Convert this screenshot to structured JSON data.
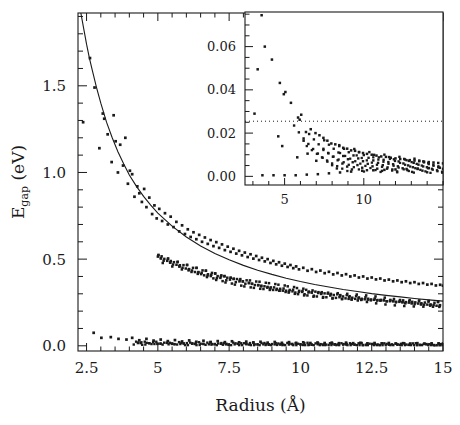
{
  "figure": {
    "background": "#ffffff",
    "ink": "#1a1a1a"
  },
  "main_axes": {
    "xlabel": "Radius (Å)",
    "ylabel_main": "E",
    "ylabel_sub": "gap",
    "ylabel_unit": " (eV)",
    "ylabel_full": "E_gap (eV)",
    "xticks": [
      "2.5",
      "5",
      "7.5",
      "10",
      "12.5",
      "15"
    ],
    "yticks": [
      "0.0",
      "0.5",
      "1.0",
      "1.5"
    ]
  },
  "inset_axes": {
    "xticks": [
      "5",
      "10"
    ],
    "yticks": [
      "0.00",
      "0.02",
      "0.04",
      "0.06"
    ]
  },
  "chart_data": {
    "type": "scatter",
    "title": "",
    "xlabel": "Radius (Å)",
    "ylabel": "E_gap (eV)",
    "xlim": [
      2.2,
      15.0
    ],
    "ylim": [
      -0.03,
      1.92
    ],
    "xticks": [
      2.5,
      5,
      7.5,
      10,
      12.5,
      15
    ],
    "yticks": [
      0.0,
      0.5,
      1.0,
      1.5
    ],
    "grid": false,
    "legend": null,
    "series": [
      {
        "name": "fit-curve",
        "type": "line",
        "note": "smooth 1/R-like decay fitted through upper scatter band",
        "points": [
          [
            2.3,
            1.92
          ],
          [
            2.4,
            1.83
          ],
          [
            2.5,
            1.74
          ],
          [
            2.6,
            1.66
          ],
          [
            2.7,
            1.59
          ],
          [
            2.85,
            1.49
          ],
          [
            3.0,
            1.4
          ],
          [
            3.2,
            1.29
          ],
          [
            3.4,
            1.2
          ],
          [
            3.6,
            1.12
          ],
          [
            3.8,
            1.05
          ],
          [
            4.0,
            0.985
          ],
          [
            4.25,
            0.92
          ],
          [
            4.5,
            0.862
          ],
          [
            4.75,
            0.812
          ],
          [
            5.0,
            0.766
          ],
          [
            5.5,
            0.69
          ],
          [
            6.0,
            0.628
          ],
          [
            6.5,
            0.576
          ],
          [
            7.0,
            0.533
          ],
          [
            7.5,
            0.496
          ],
          [
            8.0,
            0.464
          ],
          [
            8.5,
            0.436
          ],
          [
            9.0,
            0.412
          ],
          [
            9.5,
            0.39
          ],
          [
            10.0,
            0.371
          ],
          [
            10.5,
            0.354
          ],
          [
            11.0,
            0.339
          ],
          [
            11.5,
            0.325
          ],
          [
            12.0,
            0.313
          ],
          [
            12.5,
            0.301
          ],
          [
            13.0,
            0.291
          ],
          [
            13.5,
            0.282
          ],
          [
            14.0,
            0.273
          ],
          [
            14.5,
            0.265
          ],
          [
            15.0,
            0.258
          ]
        ]
      },
      {
        "name": "upper-band-points",
        "type": "scatter",
        "note": "calculated gap values, scatter about the fit; density increases with radius",
        "points": [
          [
            2.38,
            1.29
          ],
          [
            2.62,
            1.66
          ],
          [
            2.78,
            1.49
          ],
          [
            2.95,
            1.14
          ],
          [
            3.07,
            1.34
          ],
          [
            3.12,
            1.31
          ],
          [
            3.24,
            1.22
          ],
          [
            3.38,
            1.06
          ],
          [
            3.45,
            1.33
          ],
          [
            3.52,
            1.18
          ],
          [
            3.6,
            1.0
          ],
          [
            3.68,
            1.16
          ],
          [
            3.78,
            1.04
          ],
          [
            3.86,
            1.2
          ],
          [
            3.95,
            0.935
          ],
          [
            4.02,
            1.01
          ],
          [
            4.1,
            0.99
          ],
          [
            4.18,
            0.86
          ],
          [
            4.28,
            0.92
          ],
          [
            4.35,
            0.88
          ],
          [
            4.44,
            0.83
          ],
          [
            4.52,
            0.905
          ],
          [
            4.6,
            0.8
          ],
          [
            4.7,
            0.855
          ],
          [
            4.8,
            0.76
          ],
          [
            4.88,
            0.81
          ],
          [
            4.96,
            0.735
          ],
          [
            5.05,
            0.79
          ],
          [
            5.15,
            0.72
          ],
          [
            5.25,
            0.765
          ],
          [
            5.35,
            0.7
          ],
          [
            5.45,
            0.745
          ],
          [
            5.55,
            0.685
          ],
          [
            5.65,
            0.715
          ],
          [
            5.75,
            0.66
          ],
          [
            5.85,
            0.695
          ],
          [
            5.95,
            0.645
          ],
          [
            6.05,
            0.672
          ],
          [
            6.15,
            0.628
          ],
          [
            6.25,
            0.655
          ],
          [
            6.35,
            0.615
          ],
          [
            6.45,
            0.64
          ],
          [
            6.55,
            0.6
          ],
          [
            6.65,
            0.625
          ],
          [
            6.75,
            0.588
          ],
          [
            6.85,
            0.61
          ],
          [
            6.95,
            0.575
          ],
          [
            7.05,
            0.598
          ],
          [
            7.15,
            0.565
          ],
          [
            7.25,
            0.585
          ],
          [
            7.35,
            0.552
          ],
          [
            7.45,
            0.572
          ],
          [
            7.55,
            0.542
          ],
          [
            7.65,
            0.56
          ],
          [
            7.75,
            0.532
          ],
          [
            7.85,
            0.548
          ],
          [
            7.95,
            0.522
          ],
          [
            8.05,
            0.538
          ],
          [
            8.15,
            0.512
          ],
          [
            8.25,
            0.528
          ],
          [
            8.35,
            0.503
          ],
          [
            8.45,
            0.518
          ],
          [
            8.55,
            0.495
          ],
          [
            8.65,
            0.508
          ],
          [
            8.75,
            0.487
          ],
          [
            8.85,
            0.5
          ],
          [
            8.95,
            0.478
          ],
          [
            9.05,
            0.49
          ],
          [
            9.15,
            0.47
          ],
          [
            9.25,
            0.482
          ],
          [
            9.35,
            0.462
          ],
          [
            9.45,
            0.474
          ],
          [
            9.55,
            0.455
          ],
          [
            9.65,
            0.466
          ],
          [
            9.75,
            0.448
          ],
          [
            9.85,
            0.458
          ],
          [
            9.95,
            0.441
          ],
          [
            10.1,
            0.45
          ],
          [
            10.25,
            0.433
          ],
          [
            10.4,
            0.442
          ],
          [
            10.55,
            0.426
          ],
          [
            10.7,
            0.434
          ],
          [
            10.85,
            0.419
          ],
          [
            11.0,
            0.427
          ],
          [
            11.15,
            0.412
          ],
          [
            11.3,
            0.42
          ],
          [
            11.45,
            0.406
          ],
          [
            11.6,
            0.413
          ],
          [
            11.75,
            0.4
          ],
          [
            11.9,
            0.406
          ],
          [
            12.05,
            0.394
          ],
          [
            12.2,
            0.4
          ],
          [
            12.35,
            0.388
          ],
          [
            12.5,
            0.394
          ],
          [
            12.65,
            0.383
          ],
          [
            12.8,
            0.388
          ],
          [
            12.95,
            0.377
          ],
          [
            13.1,
            0.382
          ],
          [
            13.25,
            0.372
          ],
          [
            13.4,
            0.377
          ],
          [
            13.55,
            0.367
          ],
          [
            13.7,
            0.372
          ],
          [
            13.85,
            0.362
          ],
          [
            14.0,
            0.367
          ],
          [
            14.15,
            0.357
          ],
          [
            14.3,
            0.362
          ],
          [
            14.45,
            0.353
          ],
          [
            14.6,
            0.357
          ],
          [
            14.75,
            0.348
          ],
          [
            14.9,
            0.352
          ],
          [
            15.0,
            0.347
          ]
        ]
      },
      {
        "name": "lower-band-points",
        "type": "scatter",
        "note": "near-zero band, values below ~0.1 eV collapsing to 0",
        "points": [
          [
            2.75,
            0.075
          ],
          [
            3.02,
            0.046
          ],
          [
            3.35,
            0.05
          ],
          [
            3.62,
            0.04
          ],
          [
            3.9,
            0.036
          ],
          [
            4.1,
            0.046
          ],
          [
            4.35,
            0.032
          ],
          [
            4.6,
            0.04
          ],
          [
            4.85,
            0.03
          ],
          [
            5.1,
            0.036
          ],
          [
            5.35,
            0.027
          ],
          [
            5.6,
            0.033
          ],
          [
            5.85,
            0.025
          ],
          [
            6.1,
            0.031
          ],
          [
            6.35,
            0.023
          ],
          [
            6.6,
            0.029
          ],
          [
            6.85,
            0.022
          ],
          [
            7.1,
            0.027
          ],
          [
            7.35,
            0.021
          ],
          [
            7.6,
            0.026
          ],
          [
            7.85,
            0.02
          ],
          [
            8.1,
            0.024
          ],
          [
            8.35,
            0.019
          ],
          [
            8.6,
            0.023
          ],
          [
            8.85,
            0.018
          ],
          [
            9.1,
            0.022
          ],
          [
            9.35,
            0.017
          ],
          [
            9.6,
            0.021
          ],
          [
            9.85,
            0.017
          ],
          [
            10.1,
            0.02
          ],
          [
            10.35,
            0.016
          ],
          [
            10.6,
            0.019
          ],
          [
            10.85,
            0.016
          ],
          [
            11.1,
            0.018
          ],
          [
            11.35,
            0.015
          ],
          [
            11.6,
            0.018
          ],
          [
            11.85,
            0.015
          ],
          [
            12.1,
            0.017
          ],
          [
            12.35,
            0.014
          ],
          [
            12.6,
            0.016
          ],
          [
            12.85,
            0.014
          ],
          [
            13.1,
            0.016
          ],
          [
            13.35,
            0.013
          ],
          [
            13.6,
            0.015
          ],
          [
            13.85,
            0.013
          ],
          [
            14.1,
            0.015
          ],
          [
            14.35,
            0.013
          ],
          [
            14.6,
            0.014
          ],
          [
            14.85,
            0.013
          ],
          [
            15.0,
            0.013
          ]
        ]
      }
    ],
    "inset": {
      "type": "scatter",
      "xlim": [
        2.5,
        15.0
      ],
      "ylim": [
        -0.004,
        0.076
      ],
      "xticks": [
        5,
        10
      ],
      "yticks": [
        0.0,
        0.02,
        0.04,
        0.06
      ],
      "grid": false,
      "reference_line": {
        "name": "dotted-threshold",
        "style": "dotted",
        "y": 0.0255
      },
      "series": [
        {
          "name": "inset-upper-points",
          "type": "scatter",
          "points": [
            [
              3.55,
              0.0745
            ],
            [
              3.3,
              0.0495
            ],
            [
              3.75,
              0.06
            ],
            [
              4.2,
              0.054
            ],
            [
              4.7,
              0.0432
            ],
            [
              5.05,
              0.039
            ],
            [
              4.95,
              0.038
            ],
            [
              5.4,
              0.034
            ],
            [
              3.1,
              0.029
            ],
            [
              5.85,
              0.0272
            ],
            [
              6.05,
              0.0285
            ],
            [
              5.95,
              0.0262
            ],
            [
              4.6,
              0.0185
            ],
            [
              4.85,
              0.014
            ],
            [
              6.35,
              0.0205
            ],
            [
              6.65,
              0.0218
            ],
            [
              6.95,
              0.02
            ],
            [
              6.2,
              0.0165
            ],
            [
              7.2,
              0.019
            ],
            [
              7.45,
              0.0178
            ],
            [
              5.8,
              0.0088
            ],
            [
              6.45,
              0.0105
            ],
            [
              7.0,
              0.0072
            ],
            [
              7.7,
              0.0165
            ],
            [
              7.95,
              0.0152
            ],
            [
              8.2,
              0.0148
            ],
            [
              8.45,
              0.014
            ],
            [
              8.7,
              0.0132
            ],
            [
              8.95,
              0.0128
            ],
            [
              9.2,
              0.012
            ],
            [
              9.45,
              0.0118
            ],
            [
              9.7,
              0.0112
            ],
            [
              9.95,
              0.0108
            ],
            [
              10.2,
              0.0104
            ],
            [
              10.5,
              0.01
            ],
            [
              10.8,
              0.0096
            ],
            [
              11.1,
              0.0092
            ],
            [
              11.4,
              0.009
            ],
            [
              11.7,
              0.0086
            ],
            [
              12.0,
              0.0083
            ],
            [
              12.3,
              0.008
            ],
            [
              12.6,
              0.0078
            ],
            [
              12.9,
              0.0075
            ],
            [
              13.2,
              0.0073
            ],
            [
              13.5,
              0.007
            ],
            [
              13.8,
              0.0068
            ],
            [
              14.1,
              0.0066
            ],
            [
              14.4,
              0.0064
            ],
            [
              14.7,
              0.0062
            ],
            [
              15.0,
              0.006
            ]
          ]
        },
        {
          "name": "inset-baseline-points",
          "type": "scatter",
          "points": [
            [
              3.6,
              0.0005
            ],
            [
              4.3,
              0.0005
            ],
            [
              5.0,
              0.0005
            ],
            [
              5.7,
              0.0005
            ],
            [
              6.4,
              0.0008
            ],
            [
              7.1,
              0.001
            ],
            [
              7.8,
              0.0014
            ],
            [
              8.5,
              0.0018
            ],
            [
              9.2,
              0.0022
            ],
            [
              9.9,
              0.0026
            ],
            [
              10.6,
              0.0028
            ],
            [
              11.3,
              0.003
            ],
            [
              12.0,
              0.0032
            ],
            [
              12.7,
              0.0034
            ],
            [
              13.4,
              0.0036
            ],
            [
              14.1,
              0.0038
            ],
            [
              14.8,
              0.004
            ]
          ]
        }
      ]
    }
  }
}
